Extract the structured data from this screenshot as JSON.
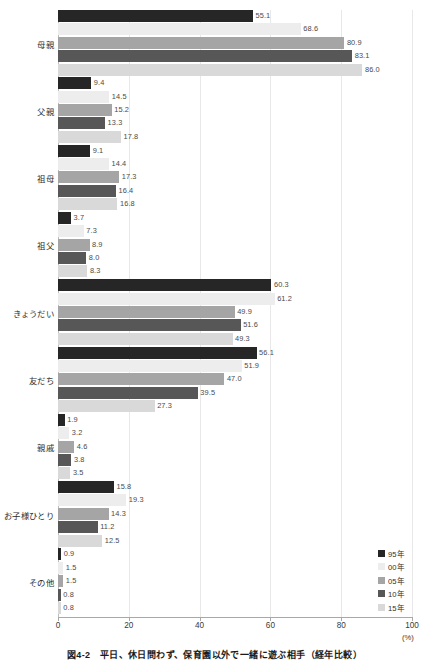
{
  "chart_data": {
    "type": "bar",
    "orientation": "horizontal",
    "title": "図4-2　平日、休日問わず、保育園以外で一緒に遊ぶ相手（経年比較）",
    "xlabel": "(%)",
    "ylabel": "",
    "xlim": [
      0,
      100
    ],
    "xticks": [
      "0",
      "20",
      "40",
      "60",
      "80",
      "100"
    ],
    "grid": true,
    "legend_position": "bottom-right",
    "categories": [
      "母親",
      "父親",
      "祖母",
      "祖父",
      "きょうだい",
      "友だち",
      "親戚",
      "お子様ひとり",
      "その他"
    ],
    "series": [
      {
        "name": "95年",
        "color": "#262626",
        "values": [
          55.1,
          9.4,
          9.1,
          3.7,
          60.3,
          56.1,
          1.9,
          15.8,
          0.9
        ]
      },
      {
        "name": "00年",
        "color": "#ededed",
        "values": [
          68.6,
          14.5,
          14.4,
          7.3,
          61.2,
          51.9,
          3.2,
          19.3,
          1.5
        ]
      },
      {
        "name": "05年",
        "color": "#a5a5a5",
        "values": [
          80.9,
          15.2,
          17.3,
          8.9,
          49.9,
          47.0,
          4.6,
          14.3,
          1.5
        ]
      },
      {
        "name": "10年",
        "color": "#575757",
        "values": [
          83.1,
          13.3,
          16.4,
          8.0,
          51.6,
          39.5,
          3.8,
          11.2,
          0.8
        ]
      },
      {
        "name": "15年",
        "color": "#d9d9d9",
        "values": [
          86.0,
          17.8,
          16.8,
          8.3,
          49.3,
          27.3,
          3.5,
          12.5,
          0.8
        ]
      }
    ]
  },
  "legend": {
    "items": [
      {
        "label": "95年",
        "color": "#262626"
      },
      {
        "label": "00年",
        "color": "#ededed"
      },
      {
        "label": "05年",
        "color": "#a5a5a5"
      },
      {
        "label": "10年",
        "color": "#575757"
      },
      {
        "label": "15年",
        "color": "#d9d9d9"
      }
    ]
  },
  "axis": {
    "unit": "(%)"
  },
  "caption": {
    "text": "図4-2　平日、休日問わず、保育園以外で一緒に遊ぶ相手（経年比較）"
  }
}
